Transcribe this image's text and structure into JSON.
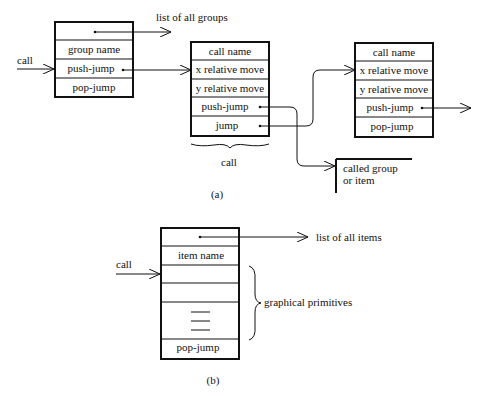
{
  "part_a": {
    "caption": "(a)",
    "list_of_groups_label": "list of all groups",
    "call_label": "call",
    "group_box": {
      "rows": [
        "",
        "group name",
        "push-jump",
        "pop-jump"
      ]
    },
    "call_box_1": {
      "rows": [
        "call name",
        "x relative move",
        "y relative move",
        "push-jump",
        "jump"
      ]
    },
    "call_box_2": {
      "rows": [
        "call name",
        "x relative move",
        "y relative move",
        "push-jump",
        "pop-jump"
      ]
    },
    "brace_label": "call",
    "called_label_line1": "called group",
    "called_label_line2": "or item"
  },
  "part_b": {
    "caption": "(b)",
    "list_of_items_label": "list of all items",
    "call_label": "call",
    "item_box": {
      "rows": [
        "",
        "item name",
        "",
        "",
        "",
        "pop-jump"
      ]
    },
    "brace_label": "graphical primitives"
  },
  "colors": {
    "ink": "#111111",
    "background": "#ffffff"
  }
}
